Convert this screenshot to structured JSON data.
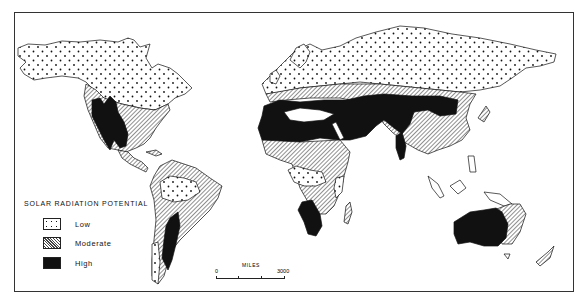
{
  "map": {
    "title": "SOLAR RADIATION POTENTIAL",
    "legend": [
      {
        "key": "low",
        "label": "Low",
        "pattern": "dotted",
        "color": "#ffffff"
      },
      {
        "key": "moderate",
        "label": "Moderate",
        "pattern": "diagonal-hatch",
        "color": "#888888"
      },
      {
        "key": "high",
        "label": "High",
        "pattern": "solid",
        "color": "#111111"
      }
    ],
    "scale": {
      "unit_label": "MILES",
      "min_label": "0",
      "max_label": "3000"
    },
    "regions": {
      "low": [
        "Alaska",
        "Canada",
        "Northern Europe",
        "Russia/Siberia",
        "Amazon Basin",
        "Central Africa (Congo)",
        "East African coast",
        "Southern Chile"
      ],
      "moderate": [
        "Eastern/Central United States",
        "Central America",
        "Eastern South America",
        "Southern Africa east",
        "Central Asia steppe",
        "China",
        "Southeast Asia",
        "Eastern Australia"
      ],
      "high": [
        "Southwestern United States/Mexico",
        "Western Argentina/Chile",
        "North Africa/Sahara",
        "Arabian Peninsula",
        "Middle East/Iran",
        "Western China/Tibet",
        "Southwest Africa",
        "Central/Western Australia"
      ]
    }
  }
}
